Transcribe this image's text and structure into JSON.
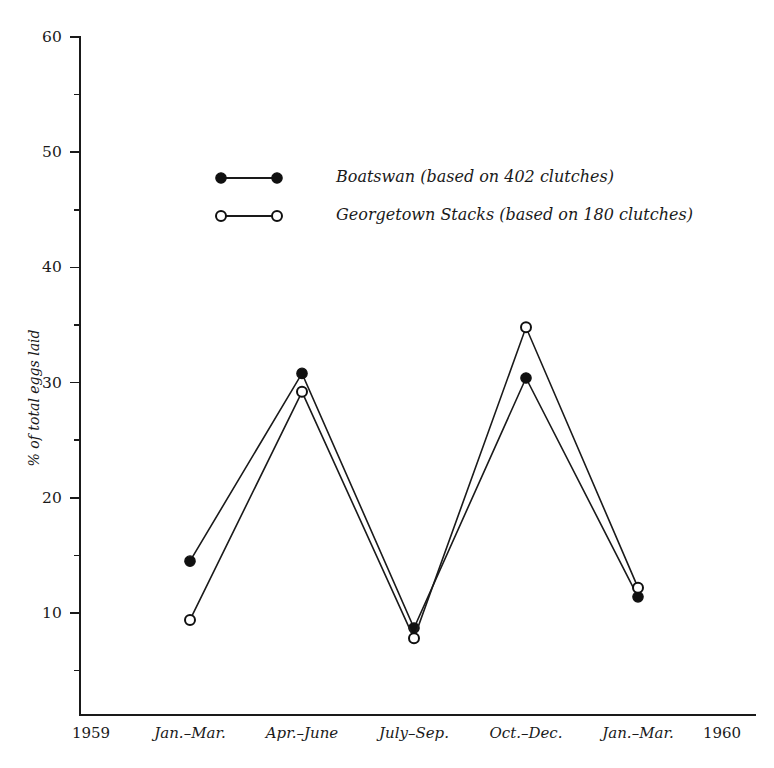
{
  "chart_data": {
    "type": "line",
    "title": "",
    "subtitle": "",
    "xlabel": "",
    "ylabel": "% of total eggs laid",
    "categories": [
      "Jan.–Mar.",
      "Apr.–June",
      "July–Sep.",
      "Oct.–Dec.",
      "Jan.–Mar."
    ],
    "series": [
      {
        "name": "Boatswan (based on 402 clutches)",
        "short_name": "Boatswan",
        "marker": "filled-circle",
        "clutches": 402,
        "values": [
          14.5,
          30.8,
          8.7,
          30.4,
          11.4
        ]
      },
      {
        "name": "Georgetown Stacks (based on 180 clutches)",
        "short_name": "Georgetown Stacks",
        "marker": "open-circle",
        "clutches": 180,
        "values": [
          9.4,
          29.2,
          7.8,
          34.8,
          12.2
        ]
      }
    ],
    "ylim": [
      0,
      60
    ],
    "yticks": [
      10,
      20,
      30,
      40,
      50,
      60
    ],
    "ytick_labels": [
      "10",
      "20",
      "30",
      "40",
      "50",
      "60"
    ],
    "yminor_ticks": [
      5,
      15,
      25,
      35,
      45,
      55
    ],
    "xlim_labels": {
      "left": "1959",
      "right": "1960"
    },
    "grid": false,
    "legend_position": "upper-left-inside",
    "line_color": "#1a1a1a"
  },
  "axis": {
    "y_title": "% of total eggs laid",
    "x_start_label": "1959",
    "x_end_label": "1960"
  },
  "legend": {
    "entries": [
      {
        "label": "Boatswan (based on 402 clutches)",
        "marker": "filled-circle"
      },
      {
        "label": "Georgetown Stacks (based on 180 clutches)",
        "marker": "open-circle"
      }
    ]
  }
}
